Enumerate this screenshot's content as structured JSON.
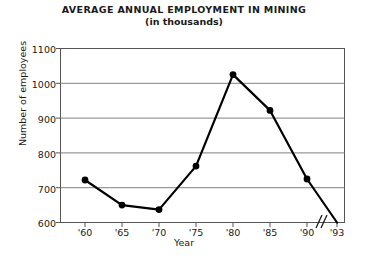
{
  "chart_data": {
    "type": "line",
    "title": "AVERAGE ANNUAL EMPLOYMENT IN MINING",
    "subtitle": "(in thousands)",
    "xlabel": "Year",
    "ylabel": "Number of employees",
    "categories": [
      "'60",
      "'65",
      "'70",
      "'75",
      "'80",
      "'85",
      "'90",
      "'93"
    ],
    "values": [
      722,
      650,
      637,
      762,
      1025,
      922,
      725,
      600
    ],
    "series": [
      {
        "name": "Average annual employment in mining",
        "values": [
          722,
          650,
          637,
          762,
          1025,
          922,
          725,
          600
        ]
      }
    ],
    "ylim": [
      600,
      1100
    ],
    "ytick_labels": [
      "1100",
      "1000",
      "900",
      "800",
      "700",
      "600"
    ],
    "ytick_values": [
      1100,
      1000,
      900,
      800,
      700,
      600
    ],
    "xtick_labels": [
      "'60",
      "'65",
      "'70",
      "'75",
      "'80",
      "'85",
      "'90",
      "'93"
    ],
    "grid": "horizontal",
    "legend": "none",
    "axis_break": "//",
    "axis_break_note": "break in x-axis between '90 and '93",
    "marker": "filled-circle",
    "line_color": "#000000",
    "grid_color": "#808080",
    "frame_color": "#555555",
    "background_color": "#ffffff"
  }
}
